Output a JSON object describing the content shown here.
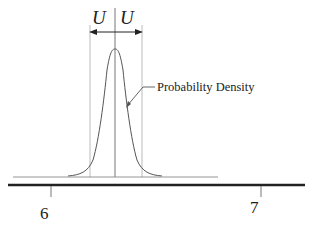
{
  "diagram": {
    "uncertainty_left_label": "U",
    "uncertainty_right_label": "U",
    "curve_label": "Probability Density",
    "axis": {
      "ticks": [
        {
          "label": "6",
          "x": 51
        },
        {
          "label": "7",
          "x": 261
        }
      ]
    },
    "colors": {
      "curve": "#555555",
      "guides": "#999999",
      "axis": "#222222"
    }
  }
}
